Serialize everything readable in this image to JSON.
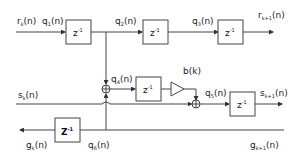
{
  "diagram": {
    "labels": {
      "rk": "r",
      "rk_sub": "k",
      "rk1": "r",
      "rk1_sub": "k+1",
      "q1": "q",
      "q1_sub": "1",
      "q2": "q",
      "q2_sub": "2",
      "q3": "q",
      "q3_sub": "3",
      "q4": "q",
      "q4_sub": "4",
      "q5": "q",
      "q5_sub": "5",
      "q6": "q",
      "q6_sub": "6",
      "sk": "s",
      "sk_sub": "k",
      "sk1": "s",
      "sk1_sub": "k+1",
      "gk": "g",
      "gk_sub": "k",
      "gk1": "g",
      "gk1_sub": "k+1",
      "arg": "(n)",
      "bk": "b(k)"
    },
    "delay": {
      "z": "z",
      "exp": "-1",
      "big_z": "Z",
      "big_exp": "-1"
    }
  }
}
